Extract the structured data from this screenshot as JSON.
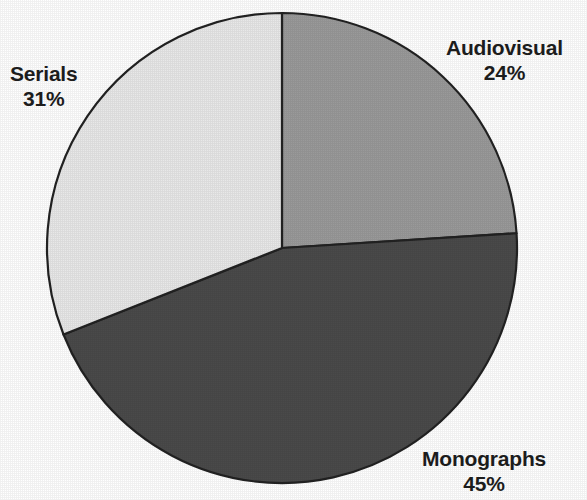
{
  "chart_data": {
    "type": "pie",
    "title": "",
    "subtitle": "",
    "xlabel": "",
    "ylabel": "",
    "legend_position": "none",
    "labels_position": "outside",
    "grid": false,
    "start_angle_deg": 0,
    "direction": "clockwise",
    "categories": [
      "Audiovisual",
      "Monographs",
      "Serials"
    ],
    "values": [
      24,
      45,
      31
    ],
    "value_unit": "%",
    "slices": [
      {
        "label": "Audiovisual",
        "value": 24,
        "value_text": "24%",
        "color": "#9a9a9a",
        "start_angle_deg": 0,
        "end_angle_deg": 86.4
      },
      {
        "label": "Monographs",
        "value": 45,
        "value_text": "45%",
        "color": "#4a4a4a",
        "start_angle_deg": 86.4,
        "end_angle_deg": 248.4
      },
      {
        "label": "Serials",
        "value": 31,
        "value_text": "31%",
        "color": "#e8e8e8",
        "start_angle_deg": 248.4,
        "end_angle_deg": 360
      }
    ]
  },
  "figure": {
    "background": "#ffffff",
    "outline_color": "#222222",
    "text_color": "#1c1c1c",
    "center_x": 282,
    "center_y": 248,
    "radius": 235
  },
  "labels": {
    "audiovisual": {
      "name": "Audiovisual",
      "percent": "24%"
    },
    "serials": {
      "name": "Serials",
      "percent": "31%"
    },
    "monographs": {
      "name": "Monographs",
      "percent": "45%"
    }
  }
}
